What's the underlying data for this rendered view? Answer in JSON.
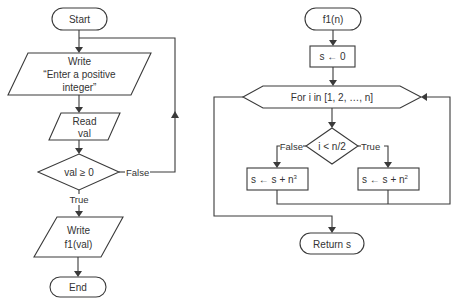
{
  "colors": {
    "stroke": "#3a3a3a",
    "text": "#333333",
    "background": "#ffffff"
  },
  "main_flow": {
    "start": "Start",
    "write_prompt": {
      "line1": "Write",
      "line2": "“Enter a positive",
      "line3": "integer”"
    },
    "read": {
      "line1": "Read",
      "line2": "val"
    },
    "decision": "val ≥ 0",
    "false_label": "False",
    "true_label": "True",
    "write_result": {
      "line1": "Write",
      "line2": "f1(val)"
    },
    "end": "End"
  },
  "function_flow": {
    "start": "f1(n)",
    "init": "s ← 0",
    "loop": "For i in [1, 2, …, n]",
    "decision": "i < n/2",
    "false_label": "False",
    "true_label": "True",
    "false_action": {
      "base": "s ← s + n",
      "exponent": "3"
    },
    "true_action": {
      "base": "s ← s + n",
      "exponent": "2"
    },
    "return": "Return s"
  }
}
